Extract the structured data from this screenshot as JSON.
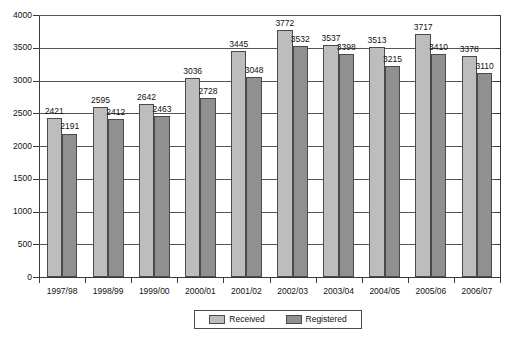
{
  "chart_data": {
    "type": "bar",
    "title": "",
    "subtitle": "",
    "xlabel": "",
    "ylabel": "",
    "ylim": [
      0,
      4000
    ],
    "ytick_step": 500,
    "yticks": [
      "0",
      "500",
      "1000",
      "1500",
      "2000",
      "2500",
      "3000",
      "3500",
      "4000"
    ],
    "grid": true,
    "legend_position": "bottom-center",
    "categories": [
      "1997/98",
      "1998/99",
      "1999/00",
      "2000/01",
      "2001/02",
      "2002/03",
      "2003/04",
      "2004/05",
      "2005/06",
      "2006/07"
    ],
    "series": [
      {
        "name": "Received",
        "color": "#bdbdbd",
        "values": [
          2421,
          2595,
          2642,
          3036,
          3445,
          3772,
          3537,
          3513,
          3717,
          3378
        ]
      },
      {
        "name": "Registered",
        "color": "#909090",
        "values": [
          2191,
          2412,
          2463,
          2728,
          3048,
          3532,
          3398,
          3215,
          3410,
          3110
        ]
      }
    ]
  },
  "legend": {
    "items": [
      {
        "label": "Received",
        "swatch": "received"
      },
      {
        "label": "Registered",
        "swatch": "registered"
      }
    ]
  },
  "colors": {
    "received": "#bdbdbd",
    "registered": "#909090",
    "axis": "#3a3a3a",
    "grid": "#555555",
    "text": "#111111",
    "background": "#ffffff"
  }
}
